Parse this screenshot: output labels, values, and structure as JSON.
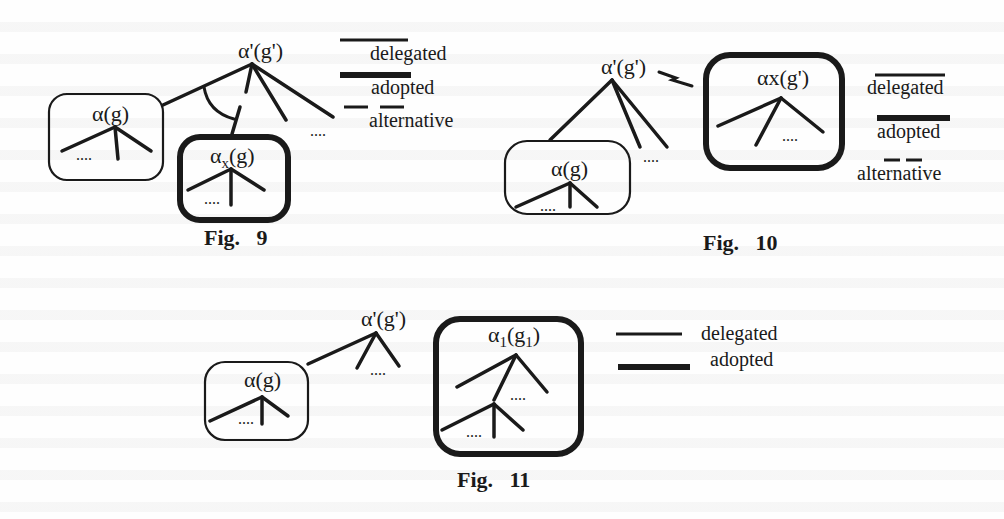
{
  "figures": [
    {
      "caption": "Fig.   9",
      "root_label": "α'(g')",
      "left_box_label": "α(g)",
      "alt_box_label_main": "α",
      "alt_box_label_sub": "x",
      "alt_box_label_arg": "(g)",
      "ellipsis": "....",
      "legend": {
        "delegated": "delegated",
        "adopted": "adopted",
        "alternative": "alternative"
      }
    },
    {
      "caption": "Fig.   10",
      "root_label": "α'(g')",
      "left_box_label": "α(g)",
      "right_box_label": "αx(g')",
      "ellipsis": "....",
      "legend": {
        "delegated": "delegated",
        "adopted": "adopted",
        "alternative": "alternative"
      }
    },
    {
      "caption": "Fig.   11",
      "root_label": "α'(g')",
      "left_box_label": "α(g)",
      "right_box_label_main": "α",
      "right_box_label_sub": "1",
      "right_box_label_arg_open": "(g",
      "right_box_label_arg_sub": "1",
      "right_box_label_arg_close": ")",
      "ellipsis": "....",
      "legend": {
        "delegated": "delegated",
        "adopted": "adopted"
      }
    }
  ]
}
